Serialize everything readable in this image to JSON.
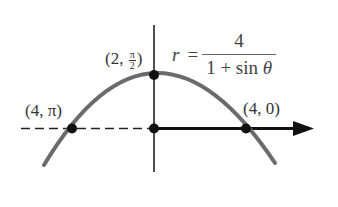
{
  "figure": {
    "equation": {
      "lhs": "r",
      "equals": "=",
      "numerator": "4",
      "denominator_prefix": "1 + sin ",
      "denominator_var": "θ"
    },
    "points": [
      {
        "id": "top",
        "label_prefix": "(2, ",
        "label_frac_num": "π",
        "label_frac_den": "2",
        "label_suffix": ")",
        "r": 2,
        "theta": "π/2"
      },
      {
        "id": "left",
        "label": "(4, π)",
        "r": 4,
        "theta": "π"
      },
      {
        "id": "right",
        "label": "(4, 0)",
        "r": 4,
        "theta": "0"
      },
      {
        "id": "origin",
        "label": ""
      }
    ],
    "curve": "parabola opening downward, focus at pole",
    "colors": {
      "curve": "#6b6b6b",
      "axis": "#1a1a1a",
      "points": "#111111"
    }
  }
}
